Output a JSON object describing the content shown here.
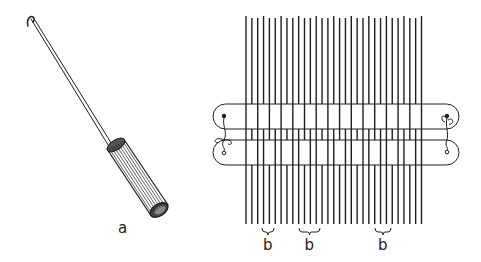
{
  "figure": {
    "background": "#ffffff",
    "ink": "#1e1e1e",
    "tool": {
      "label": "a",
      "description": "hook with fluted handle",
      "label_pos": [
        121,
        226
      ]
    },
    "loom": {
      "warp_thread_count": 31,
      "warp_x_start": 246,
      "warp_spacing": 5.85,
      "warp_top": 17,
      "warp_bottom": 224,
      "sticks": [
        {
          "name": "upper-stick",
          "x1": 213,
          "x2": 459,
          "top": 104,
          "bottom": 129
        },
        {
          "name": "lower-stick",
          "x1": 213,
          "x2": 459,
          "top": 140,
          "bottom": 165
        }
      ],
      "group_labels": [
        {
          "text": "b",
          "brace_x1": 262,
          "brace_x2": 274,
          "label_x": 262
        },
        {
          "text": "b",
          "brace_x1": 299,
          "brace_x2": 320,
          "label_x": 304
        },
        {
          "text": "b",
          "brace_x1": 375,
          "brace_x2": 391,
          "label_x": 378
        }
      ]
    }
  }
}
